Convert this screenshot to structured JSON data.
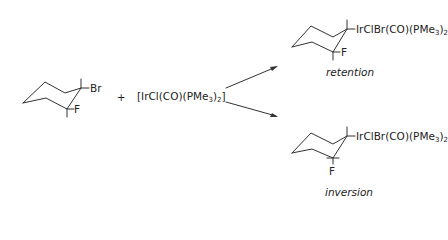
{
  "reactant": {
    "substituent_top": "Br",
    "substituent_bottom": "F"
  },
  "plus": "+",
  "reagent": {
    "prefix": "[IrCl(CO)(PMe",
    "sub1": "3",
    "mid": ")",
    "sub2": "2",
    "suffix": "]"
  },
  "products": [
    {
      "label_prefix": "IrClBr(CO)(PMe",
      "label_sub1": "3",
      "label_mid": ")",
      "label_sub2": "2",
      "f_label": "F",
      "caption": "retention"
    },
    {
      "label_prefix": "IrClBr(CO)(PMe",
      "label_sub1": "3",
      "label_mid": ")",
      "label_sub2": "2",
      "f_label": "F",
      "caption": "inversion"
    }
  ]
}
